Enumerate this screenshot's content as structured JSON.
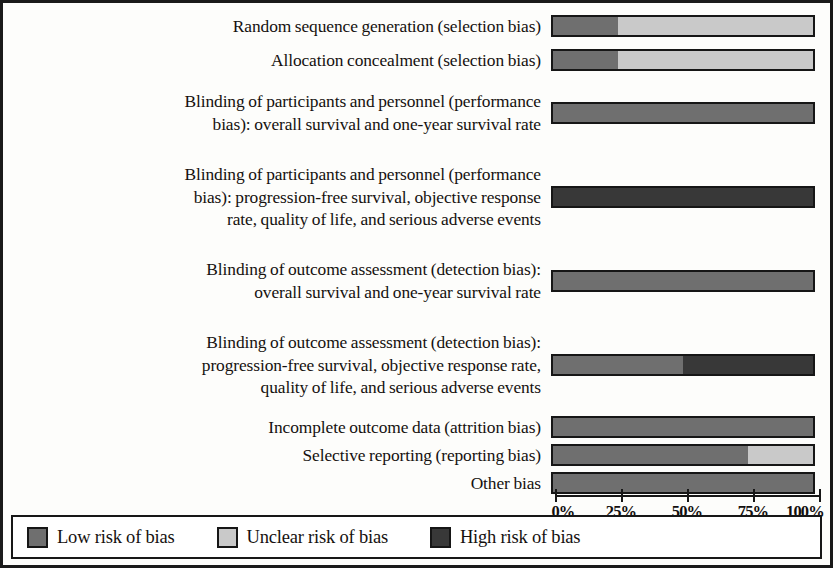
{
  "chart_data": {
    "type": "bar",
    "orientation": "horizontal",
    "stacked": true,
    "title": "",
    "xlabel": "",
    "ylabel": "",
    "xlim": [
      0,
      100
    ],
    "grid": false,
    "legend_position": "bottom",
    "tick_labels": [
      "0%",
      "25%",
      "50%",
      "75%",
      "100%"
    ],
    "tick_values": [
      0,
      25,
      50,
      75,
      100
    ],
    "series": [
      {
        "name": "Low risk of bias",
        "color": "#6f6f6f",
        "values": [
          25,
          25,
          100,
          0,
          100,
          50,
          100,
          75,
          100
        ]
      },
      {
        "name": "Unclear risk of bias",
        "color": "#c9c9c9",
        "values": [
          75,
          75,
          0,
          0,
          0,
          0,
          0,
          25,
          0
        ]
      },
      {
        "name": "High risk of bias",
        "color": "#383838",
        "values": [
          0,
          0,
          0,
          100,
          0,
          50,
          0,
          0,
          0
        ]
      }
    ],
    "categories": [
      "Random sequence generation (selection bias)",
      "Allocation concealment (selection bias)",
      "Blinding of participants and personnel (performance bias): overall survival and one-year survival rate",
      "Blinding of participants and personnel (performance bias): progression-free survival, objective response rate, quality of life, and serious adverse events",
      "Blinding of outcome assessment (detection bias): overall survival and one-year survival rate",
      "Blinding of outcome assessment (detection bias): progression-free survival, objective response rate, quality of life, and serious adverse events",
      "Incomplete outcome data (attrition bias)",
      "Selective reporting (reporting bias)",
      "Other bias"
    ]
  },
  "rows": [
    {
      "label": "Random sequence generation (selection bias)",
      "label_lines": [
        "Random sequence generation (selection bias)"
      ],
      "segments": [
        {
          "risk": "Low risk of bias",
          "percent": 25,
          "color": "#6f6f6f"
        },
        {
          "risk": "Unclear risk of bias",
          "percent": 75,
          "color": "#c9c9c9"
        }
      ]
    },
    {
      "label": "Allocation concealment (selection bias)",
      "label_lines": [
        "Allocation concealment (selection bias)"
      ],
      "segments": [
        {
          "risk": "Low risk of bias",
          "percent": 25,
          "color": "#6f6f6f"
        },
        {
          "risk": "Unclear risk of bias",
          "percent": 75,
          "color": "#c9c9c9"
        }
      ]
    },
    {
      "label": "Blinding of participants and personnel (performance bias): overall survival and one-year survival rate",
      "label_lines": [
        "Blinding of participants and personnel (performance",
        "bias): overall survival and one-year survival rate"
      ],
      "segments": [
        {
          "risk": "Low risk of bias",
          "percent": 100,
          "color": "#6f6f6f"
        }
      ]
    },
    {
      "label": "Blinding of participants and personnel (performance bias): progression-free survival, objective response rate, quality of life, and serious adverse events",
      "label_lines": [
        "Blinding of participants and personnel (performance",
        "bias): progression-free survival, objective response",
        "rate, quality of life, and serious adverse events"
      ],
      "segments": [
        {
          "risk": "High risk of bias",
          "percent": 100,
          "color": "#383838"
        }
      ]
    },
    {
      "label": "Blinding of outcome assessment (detection bias): overall survival and one-year survival rate",
      "label_lines": [
        "Blinding of outcome assessment (detection bias):",
        "overall survival and one-year survival rate"
      ],
      "segments": [
        {
          "risk": "Low risk of bias",
          "percent": 100,
          "color": "#6f6f6f"
        }
      ]
    },
    {
      "label": "Blinding of outcome assessment (detection bias): progression-free survival, objective response rate, quality of life, and serious adverse events",
      "label_lines": [
        "Blinding of outcome assessment (detection bias):",
        "progression-free survival, objective response rate,",
        "quality of life, and serious adverse events"
      ],
      "segments": [
        {
          "risk": "Low risk of bias",
          "percent": 50,
          "color": "#6f6f6f"
        },
        {
          "risk": "High risk of bias",
          "percent": 50,
          "color": "#383838"
        }
      ]
    },
    {
      "label": "Incomplete outcome data (attrition bias)",
      "label_lines": [
        "Incomplete outcome data (attrition bias)"
      ],
      "segments": [
        {
          "risk": "Low risk of bias",
          "percent": 100,
          "color": "#6f6f6f"
        }
      ]
    },
    {
      "label": "Selective reporting (reporting bias)",
      "label_lines": [
        "Selective reporting (reporting bias)"
      ],
      "segments": [
        {
          "risk": "Low risk of bias",
          "percent": 75,
          "color": "#6f6f6f"
        },
        {
          "risk": "Unclear risk of bias",
          "percent": 25,
          "color": "#c9c9c9"
        }
      ]
    },
    {
      "label": "Other bias",
      "label_lines": [
        "Other bias"
      ],
      "segments": [
        {
          "risk": "Low risk of bias",
          "percent": 100,
          "color": "#6f6f6f"
        }
      ]
    }
  ],
  "axis": {
    "ticks": [
      {
        "label": "0%",
        "value": 0
      },
      {
        "label": "25%",
        "value": 25
      },
      {
        "label": "50%",
        "value": 50
      },
      {
        "label": "75%",
        "value": 75
      },
      {
        "label": "100%",
        "value": 100
      }
    ]
  },
  "legend": {
    "items": [
      {
        "label": "Low risk of bias",
        "color": "#6f6f6f"
      },
      {
        "label": "Unclear risk of bias",
        "color": "#c9c9c9"
      },
      {
        "label": "High risk of bias",
        "color": "#383838"
      }
    ]
  },
  "colors": {
    "low_risk": "#6f6f6f",
    "unclear_risk": "#c9c9c9",
    "high_risk": "#383838",
    "frame": "#1a1a1a",
    "background": "#fdfdfb"
  }
}
